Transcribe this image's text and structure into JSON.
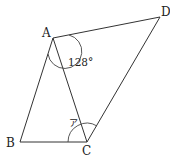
{
  "figure": {
    "type": "geometry",
    "vertices": {
      "A": {
        "label": "A",
        "x": 53,
        "y": 38
      },
      "B": {
        "label": "B",
        "x": 20,
        "y": 142
      },
      "C": {
        "label": "C",
        "x": 87,
        "y": 142
      },
      "D": {
        "label": "D",
        "x": 160,
        "y": 17
      }
    },
    "segments": [
      "AB",
      "BC",
      "CD",
      "DA",
      "AC"
    ],
    "angles": [
      {
        "vertex": "A",
        "between": [
          "AB",
          "AD"
        ],
        "label": "128°"
      },
      {
        "vertex": "C",
        "between": [
          "CB",
          "CD"
        ],
        "label": "ア"
      }
    ],
    "colors": {
      "line": "#333333",
      "text": "#222222",
      "background": "#ffffff"
    }
  }
}
